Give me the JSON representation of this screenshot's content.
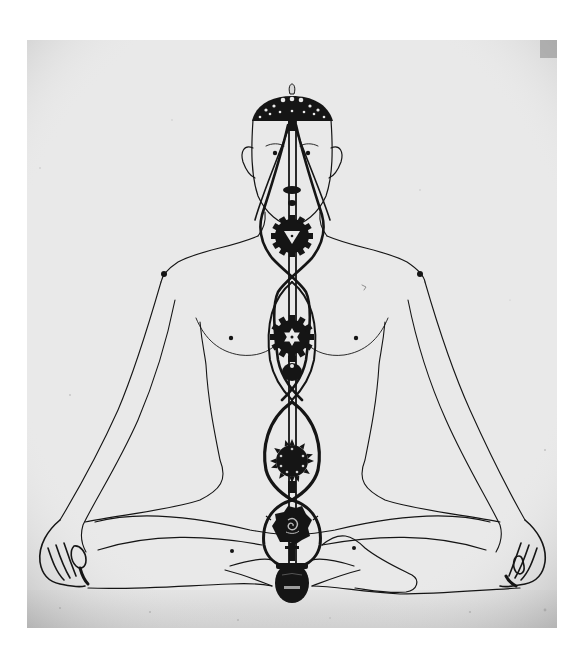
{
  "figure": {
    "style": "black ink line drawing on grey paper, scanned",
    "colors": {
      "page_background": "#ffffff",
      "paper": "#e9e9e9",
      "ink": "#151515",
      "shadow": "#b9b9b9"
    },
    "chakras": [
      {
        "name": "crown",
        "shape": "dome/umbrella",
        "y": 108
      },
      {
        "name": "third-eye",
        "shape": "small dark knot",
        "y": 190
      },
      {
        "name": "throat",
        "shape": "gear with inverted triangle",
        "y": 235
      },
      {
        "name": "heart",
        "shape": "gear with six-point star",
        "y": 336
      },
      {
        "name": "solar-plexus",
        "shape": "small dark disc",
        "y": 372
      },
      {
        "name": "navel",
        "shape": "spiked gear",
        "y": 461
      },
      {
        "name": "sacral",
        "shape": "spiked lotus with spiral",
        "y": 523
      },
      {
        "name": "root",
        "shape": "dark oval base",
        "y": 582
      }
    ],
    "channels": [
      "sushumna (central)",
      "ida (left spiral)",
      "pingala (right spiral)"
    ]
  }
}
